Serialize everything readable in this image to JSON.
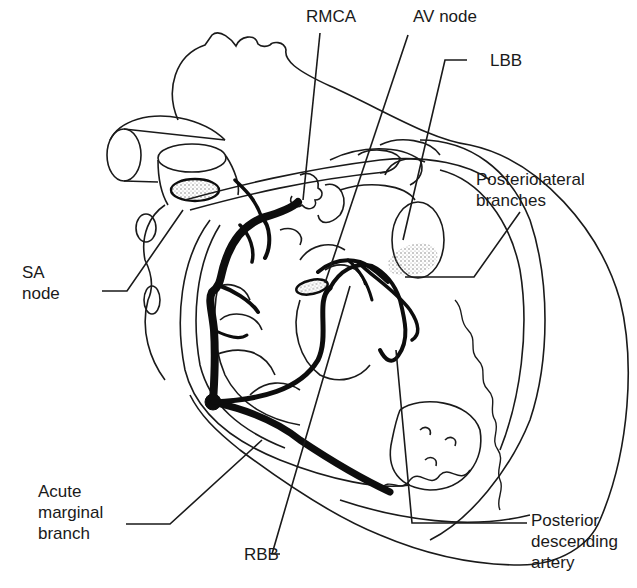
{
  "figure": {
    "type": "anatomical-diagram",
    "colors": {
      "background": "#ffffff",
      "outline": "#1a1a1a",
      "artery": "#0d0d0d",
      "stipple": "#8a8a8a"
    }
  },
  "labels": {
    "rmca": "RMCA",
    "av_node": "AV node",
    "lbb": "LBB",
    "posteriolateral": [
      "Posteriolateral",
      "branches"
    ],
    "sa_node": [
      "SA",
      "node"
    ],
    "acute_marginal": [
      "Acute",
      "marginal",
      "branch"
    ],
    "rbb": "RBB",
    "posterior_descending": [
      "Posterior",
      "descending",
      "artery"
    ]
  }
}
